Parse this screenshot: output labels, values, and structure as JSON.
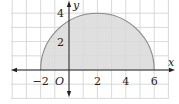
{
  "figure": {
    "type": "coordinate-plane",
    "x_axis": {
      "label": "x",
      "tick_labels": [
        "-2",
        "2",
        "4",
        "6"
      ],
      "range": [
        -4,
        7
      ]
    },
    "y_axis": {
      "label": "y",
      "tick_labels": [
        "2",
        "4"
      ],
      "range": [
        -2,
        5
      ]
    },
    "origin_label": "O",
    "shape": {
      "kind": "semicircle",
      "center": [
        2,
        0
      ],
      "radius": 4,
      "endpoints": [
        [
          -2,
          0
        ],
        [
          6,
          0
        ]
      ],
      "top": [
        2,
        4
      ],
      "shaded": true
    },
    "colors": {
      "grid": "#cfcfcf",
      "fill": "#d9d9d9",
      "curve": "#8a8a8a",
      "axis": "#222222",
      "text": "#222222"
    }
  }
}
